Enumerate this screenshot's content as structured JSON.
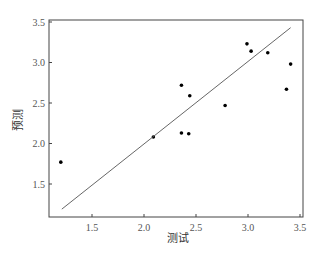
{
  "chart_data": {
    "type": "scatter",
    "title": "",
    "xlabel": "测试",
    "ylabel": "预测",
    "xlim": [
      1.1,
      3.53
    ],
    "ylim": [
      1.07,
      3.53
    ],
    "xticks": [
      1.5,
      2.0,
      2.5,
      3.0,
      3.5
    ],
    "yticks": [
      1.5,
      2.0,
      2.5,
      3.0,
      3.5
    ],
    "xtick_labels": [
      "1.5",
      "2.0",
      "2.5",
      "3.0",
      "3.5"
    ],
    "ytick_labels": [
      "1.5",
      "2.0",
      "2.5",
      "3.0",
      "3.5"
    ],
    "grid": false,
    "legend": null,
    "series": [
      {
        "name": "points",
        "marker": "dot",
        "color": "#000000",
        "x": [
          1.2,
          2.09,
          2.36,
          2.44,
          2.36,
          2.43,
          2.78,
          2.99,
          3.03,
          3.19,
          3.41,
          3.37
        ],
        "y": [
          1.77,
          2.08,
          2.72,
          2.59,
          2.13,
          2.12,
          2.47,
          3.23,
          3.14,
          3.12,
          2.98,
          2.67
        ]
      },
      {
        "name": "fit-line",
        "marker": "line",
        "color": "#555555",
        "x": [
          1.21,
          3.41
        ],
        "y": [
          1.19,
          3.43
        ]
      }
    ]
  },
  "colors": {
    "frame": "#444444",
    "points": "#000000",
    "line": "#555555",
    "text": "#444444"
  }
}
